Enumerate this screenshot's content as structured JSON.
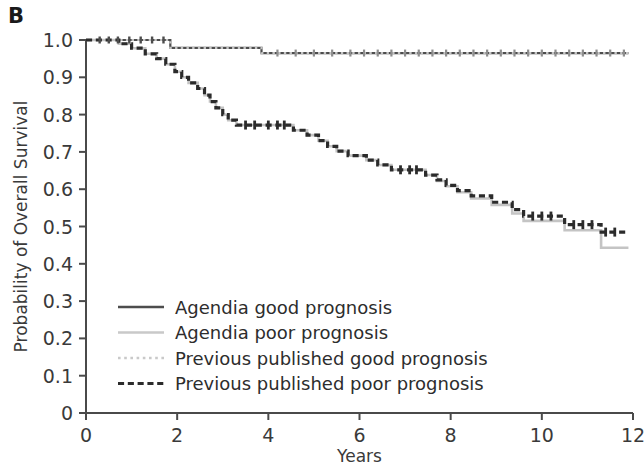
{
  "panel": {
    "label": "B"
  },
  "chart_data": {
    "type": "line",
    "title": "",
    "subtitle": "",
    "xlabel": "Years",
    "ylabel": "Probability of Overall Survival",
    "xlim": [
      0,
      12
    ],
    "ylim": [
      0,
      1.0
    ],
    "xticks": [
      0,
      2,
      4,
      6,
      8,
      10,
      12
    ],
    "xtick_labels": [
      "0",
      "2",
      "4",
      "6",
      "8",
      "10",
      "12"
    ],
    "yticks": [
      0,
      0.1,
      0.2,
      0.3,
      0.4,
      0.5,
      0.6,
      0.7,
      0.8,
      0.9,
      1.0
    ],
    "ytick_labels": [
      "0",
      "0.1",
      "0.2",
      "0.3",
      "0.4",
      "0.5",
      "0.6",
      "0.7",
      "0.8",
      "0.9",
      "1.0"
    ],
    "grid": false,
    "legend_position": "lower-left-inside",
    "series": [
      {
        "name": "Agendia good prognosis",
        "color": "#4d4d4d",
        "style": "solid",
        "width": 2.2,
        "points": [
          [
            0.0,
            1.0
          ],
          [
            1.85,
            1.0
          ],
          [
            1.85,
            0.979
          ],
          [
            3.85,
            0.979
          ],
          [
            3.85,
            0.965
          ],
          [
            11.9,
            0.965
          ]
        ]
      },
      {
        "name": "Agendia poor prognosis",
        "color": "#c4c4c4",
        "style": "solid",
        "width": 2.6,
        "points": [
          [
            0.0,
            1.0
          ],
          [
            0.72,
            1.0
          ],
          [
            0.72,
            0.99
          ],
          [
            1.0,
            0.99
          ],
          [
            1.0,
            0.978
          ],
          [
            1.3,
            0.978
          ],
          [
            1.3,
            0.963
          ],
          [
            1.55,
            0.963
          ],
          [
            1.55,
            0.95
          ],
          [
            1.75,
            0.95
          ],
          [
            1.75,
            0.935
          ],
          [
            1.95,
            0.935
          ],
          [
            1.95,
            0.915
          ],
          [
            2.1,
            0.915
          ],
          [
            2.1,
            0.9
          ],
          [
            2.25,
            0.9
          ],
          [
            2.25,
            0.885
          ],
          [
            2.45,
            0.885
          ],
          [
            2.45,
            0.87
          ],
          [
            2.6,
            0.87
          ],
          [
            2.6,
            0.852
          ],
          [
            2.72,
            0.852
          ],
          [
            2.72,
            0.835
          ],
          [
            2.85,
            0.835
          ],
          [
            2.85,
            0.818
          ],
          [
            3.0,
            0.818
          ],
          [
            3.0,
            0.8
          ],
          [
            3.12,
            0.8
          ],
          [
            3.12,
            0.785
          ],
          [
            3.3,
            0.785
          ],
          [
            3.3,
            0.772
          ],
          [
            4.55,
            0.772
          ],
          [
            4.55,
            0.758
          ],
          [
            4.85,
            0.758
          ],
          [
            4.85,
            0.745
          ],
          [
            5.1,
            0.745
          ],
          [
            5.1,
            0.73
          ],
          [
            5.3,
            0.73
          ],
          [
            5.3,
            0.715
          ],
          [
            5.5,
            0.715
          ],
          [
            5.5,
            0.702
          ],
          [
            5.75,
            0.702
          ],
          [
            5.75,
            0.69
          ],
          [
            6.15,
            0.69
          ],
          [
            6.15,
            0.678
          ],
          [
            6.4,
            0.678
          ],
          [
            6.4,
            0.665
          ],
          [
            6.7,
            0.665
          ],
          [
            6.7,
            0.652
          ],
          [
            7.45,
            0.652
          ],
          [
            7.45,
            0.638
          ],
          [
            7.7,
            0.638
          ],
          [
            7.7,
            0.622
          ],
          [
            7.9,
            0.622
          ],
          [
            7.9,
            0.608
          ],
          [
            8.15,
            0.608
          ],
          [
            8.15,
            0.592
          ],
          [
            8.45,
            0.592
          ],
          [
            8.45,
            0.575
          ],
          [
            8.9,
            0.575
          ],
          [
            8.9,
            0.558
          ],
          [
            9.35,
            0.558
          ],
          [
            9.35,
            0.535
          ],
          [
            9.6,
            0.535
          ],
          [
            9.6,
            0.515
          ],
          [
            10.5,
            0.515
          ],
          [
            10.5,
            0.49
          ],
          [
            11.3,
            0.49
          ],
          [
            11.3,
            0.443
          ],
          [
            11.9,
            0.443
          ]
        ]
      },
      {
        "name": "Previous published good prognosis",
        "color": "#c4c4c4",
        "style": "dotted",
        "width": 2.2,
        "points": [
          [
            0.0,
            1.0
          ],
          [
            1.85,
            1.0
          ],
          [
            1.85,
            0.979
          ],
          [
            3.85,
            0.979
          ],
          [
            3.85,
            0.965
          ],
          [
            11.9,
            0.965
          ]
        ]
      },
      {
        "name": "Previous published poor prognosis",
        "color": "#2b2b2b",
        "style": "dashed",
        "width": 3.2,
        "points": [
          [
            0.0,
            1.0
          ],
          [
            0.72,
            1.0
          ],
          [
            0.72,
            0.99
          ],
          [
            1.0,
            0.99
          ],
          [
            1.0,
            0.978
          ],
          [
            1.3,
            0.978
          ],
          [
            1.3,
            0.963
          ],
          [
            1.55,
            0.963
          ],
          [
            1.55,
            0.95
          ],
          [
            1.75,
            0.95
          ],
          [
            1.75,
            0.935
          ],
          [
            1.95,
            0.935
          ],
          [
            1.95,
            0.915
          ],
          [
            2.1,
            0.915
          ],
          [
            2.1,
            0.9
          ],
          [
            2.25,
            0.9
          ],
          [
            2.25,
            0.885
          ],
          [
            2.45,
            0.885
          ],
          [
            2.45,
            0.87
          ],
          [
            2.6,
            0.87
          ],
          [
            2.6,
            0.852
          ],
          [
            2.72,
            0.852
          ],
          [
            2.72,
            0.835
          ],
          [
            2.85,
            0.835
          ],
          [
            2.85,
            0.818
          ],
          [
            3.0,
            0.818
          ],
          [
            3.0,
            0.8
          ],
          [
            3.12,
            0.8
          ],
          [
            3.12,
            0.785
          ],
          [
            3.3,
            0.785
          ],
          [
            3.3,
            0.772
          ],
          [
            4.55,
            0.772
          ],
          [
            4.55,
            0.758
          ],
          [
            4.85,
            0.758
          ],
          [
            4.85,
            0.745
          ],
          [
            5.1,
            0.745
          ],
          [
            5.1,
            0.73
          ],
          [
            5.3,
            0.73
          ],
          [
            5.3,
            0.715
          ],
          [
            5.5,
            0.715
          ],
          [
            5.5,
            0.702
          ],
          [
            5.75,
            0.702
          ],
          [
            5.75,
            0.69
          ],
          [
            6.15,
            0.69
          ],
          [
            6.15,
            0.678
          ],
          [
            6.4,
            0.678
          ],
          [
            6.4,
            0.665
          ],
          [
            6.7,
            0.665
          ],
          [
            6.7,
            0.652
          ],
          [
            7.45,
            0.652
          ],
          [
            7.45,
            0.638
          ],
          [
            7.7,
            0.638
          ],
          [
            7.7,
            0.625
          ],
          [
            7.9,
            0.625
          ],
          [
            7.9,
            0.61
          ],
          [
            8.15,
            0.61
          ],
          [
            8.15,
            0.596
          ],
          [
            8.45,
            0.596
          ],
          [
            8.45,
            0.582
          ],
          [
            8.9,
            0.582
          ],
          [
            8.9,
            0.565
          ],
          [
            9.35,
            0.565
          ],
          [
            9.35,
            0.545
          ],
          [
            9.6,
            0.545
          ],
          [
            9.6,
            0.528
          ],
          [
            10.5,
            0.528
          ],
          [
            10.5,
            0.505
          ],
          [
            11.3,
            0.505
          ],
          [
            11.3,
            0.485
          ],
          [
            11.9,
            0.485
          ]
        ]
      }
    ],
    "censor_marks": {
      "agendia_good": [
        0.3,
        0.5,
        0.7,
        0.95,
        1.2,
        1.45,
        1.7
      ],
      "previous_good": [
        4.2,
        4.6,
        5.0,
        5.4,
        5.8,
        6.1,
        6.4,
        6.7,
        7.0,
        7.3,
        7.6,
        7.9,
        8.2,
        8.5,
        8.8,
        9.1,
        9.4,
        9.7,
        10.0,
        10.3,
        10.6,
        10.9,
        11.2,
        11.5,
        11.8
      ],
      "poor": [
        3.5,
        3.7,
        4.0,
        4.2,
        4.35,
        6.9,
        7.1,
        7.25,
        9.8,
        10.0,
        10.2,
        10.7,
        10.9,
        11.1,
        11.4,
        11.6
      ]
    }
  },
  "legend": {
    "entries": [
      {
        "label": "Agendia good prognosis",
        "color": "#4d4d4d",
        "style": "solid"
      },
      {
        "label": "Agendia poor prognosis",
        "color": "#c9c9c9",
        "style": "solid"
      },
      {
        "label": "Previous published good prognosis",
        "color": "#c9c9c9",
        "style": "dotted"
      },
      {
        "label": "Previous published poor prognosis",
        "color": "#2b2b2b",
        "style": "dashed"
      }
    ]
  },
  "colors": {
    "axis": "#4a4a4a",
    "text": "#333333",
    "agendia_good": "#4d4d4d",
    "agendia_poor": "#c9c9c9",
    "previous_good": "#c9c9c9",
    "previous_poor": "#2b2b2b"
  }
}
